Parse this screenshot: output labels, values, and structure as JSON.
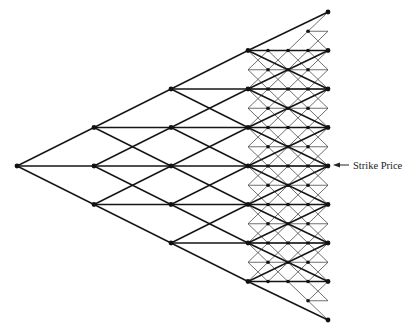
{
  "diagram": {
    "type": "trinomial-tree-with-adaptive-mesh",
    "canvas": {
      "width": 416,
      "height": 333,
      "background": "#ffffff"
    },
    "colors": {
      "coarse_line": "#151515",
      "fine_line": "#4a4a4a",
      "node": "#111111",
      "label": "#222222"
    },
    "coarse_tree": {
      "root": {
        "x": 17,
        "y": 166
      },
      "x_columns": [
        17,
        94,
        171,
        248,
        328
      ],
      "dy": 38.5,
      "levels": 4
    },
    "fine_mesh": {
      "x_columns": [
        248,
        268,
        288,
        308,
        328
      ],
      "dy": 19.25,
      "column_ranges": [
        {
          "y_top": 50,
          "y_bottom": 281
        },
        {
          "y_top": 50,
          "y_bottom": 281
        },
        {
          "y_top": 50,
          "y_bottom": 281
        },
        {
          "y_top": 31,
          "y_bottom": 301
        },
        {
          "y_top": 12,
          "y_bottom": 320
        }
      ]
    },
    "annotation": {
      "label": "Strike Price",
      "arrow_from": {
        "x": 349,
        "y": 165
      },
      "arrow_to": {
        "x": 333,
        "y": 165
      },
      "text_x": 353,
      "text_y": 169
    }
  }
}
